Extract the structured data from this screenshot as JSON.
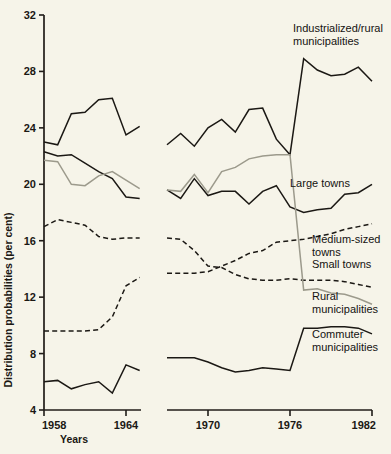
{
  "chart_data": {
    "type": "line",
    "title": "",
    "xlabel": "Years",
    "ylabel": "Distribution probabilities (per cent)",
    "xlim": [
      1958,
      1982
    ],
    "ylim": [
      4,
      32
    ],
    "xticks": [
      1958,
      1964,
      1970,
      1976,
      1982
    ],
    "yticks": [
      4,
      8,
      12,
      16,
      20,
      24,
      28,
      32
    ],
    "grid": false,
    "legend_position": "inline-right",
    "axis_break": {
      "after_x": 1965,
      "before_x": 1967
    },
    "series": [
      {
        "name": "Industrialized/rural municipalities",
        "style": "solid",
        "color": "#1b1814",
        "label_x": 1977.4,
        "label_y": 31.1,
        "segments": [
          {
            "x": [
              1958,
              1959,
              1960,
              1961,
              1962,
              1963,
              1964,
              1965
            ],
            "y": [
              23.0,
              22.8,
              25.0,
              25.1,
              26.0,
              26.1,
              23.5,
              24.1
            ]
          },
          {
            "x": [
              1967,
              1968,
              1969,
              1970,
              1971,
              1972,
              1973,
              1974,
              1975,
              1976,
              1977,
              1978,
              1979,
              1980,
              1981,
              1982
            ],
            "y": [
              22.8,
              23.6,
              22.7,
              24.0,
              24.6,
              23.7,
              25.3,
              25.4,
              23.2,
              22.1,
              28.9,
              28.1,
              27.7,
              27.8,
              28.3,
              27.3
            ]
          }
        ]
      },
      {
        "name": "Large towns",
        "style": "solid",
        "color": "#1b1814",
        "label_x": 1977.0,
        "label_y": 20.6,
        "segments": [
          {
            "x": [
              1958,
              1959,
              1960,
              1961,
              1962,
              1963,
              1964,
              1965
            ],
            "y": [
              22.3,
              22.0,
              22.1,
              21.5,
              20.9,
              20.4,
              19.1,
              19.0
            ]
          },
          {
            "x": [
              1967,
              1968,
              1969,
              1970,
              1971,
              1972,
              1973,
              1974,
              1975,
              1976,
              1977,
              1978,
              1979,
              1980,
              1981,
              1982
            ],
            "y": [
              19.6,
              19.0,
              20.4,
              19.2,
              19.5,
              19.5,
              18.6,
              19.5,
              19.9,
              18.4,
              18.0,
              18.2,
              18.3,
              19.3,
              19.4,
              20.0
            ]
          }
        ]
      },
      {
        "name": "Medium-sized towns",
        "style": "dashed",
        "color": "#1b1814",
        "label_x": 1977.1,
        "label_y": 15.3,
        "segments": [
          {
            "x": [
              1958,
              1959,
              1960,
              1961,
              1962,
              1963,
              1964,
              1965
            ],
            "y": [
              17.0,
              17.5,
              17.3,
              17.1,
              16.3,
              16.1,
              16.2,
              16.2
            ]
          },
          {
            "x": [
              1967,
              1968,
              1969,
              1970,
              1971,
              1972,
              1973,
              1974,
              1975,
              1976,
              1977,
              1978,
              1979,
              1980,
              1981,
              1982
            ],
            "y": [
              16.2,
              16.1,
              15.3,
              14.2,
              14.1,
              13.6,
              13.3,
              13.2,
              13.2,
              13.3,
              13.2,
              13.2,
              13.2,
              13.1,
              12.9,
              12.7
            ]
          }
        ]
      },
      {
        "name": "Small towns",
        "style": "dashed",
        "color": "#1b1814",
        "label_x": 1977.1,
        "label_y": 13.4,
        "segments": [
          {
            "x": [
              1958,
              1959,
              1960,
              1961,
              1962,
              1963,
              1964,
              1965
            ],
            "y": [
              9.6,
              9.6,
              9.6,
              9.6,
              9.7,
              10.6,
              12.8,
              13.4
            ]
          },
          {
            "x": [
              1967,
              1968,
              1969,
              1970,
              1971,
              1972,
              1973,
              1974,
              1975,
              1976,
              1977,
              1978,
              1979,
              1980,
              1981,
              1982
            ],
            "y": [
              13.7,
              13.7,
              13.7,
              13.8,
              14.2,
              14.6,
              15.1,
              15.3,
              15.9,
              16.0,
              16.1,
              16.3,
              16.5,
              16.8,
              17.0,
              17.2
            ]
          }
        ]
      },
      {
        "name": "Rural municipalities",
        "style": "solid",
        "color": "#9c9a8c",
        "label_x": 1977.2,
        "label_y": 11.9,
        "segments": [
          {
            "x": [
              1958,
              1959,
              1960,
              1961,
              1962,
              1963,
              1964,
              1965
            ],
            "y": [
              21.7,
              21.6,
              20.0,
              19.9,
              20.6,
              20.9,
              20.3,
              19.7
            ]
          },
          {
            "x": [
              1967,
              1968,
              1969,
              1970,
              1971,
              1972,
              1973,
              1974,
              1975,
              1976,
              1977,
              1978,
              1979,
              1980,
              1981,
              1982
            ],
            "y": [
              19.6,
              19.5,
              20.7,
              19.4,
              20.9,
              21.2,
              21.8,
              22.0,
              22.1,
              22.1,
              12.5,
              12.6,
              12.3,
              12.2,
              11.9,
              11.5
            ]
          }
        ]
      },
      {
        "name": "Commuter municipalities",
        "style": "solid",
        "color": "#1b1814",
        "label_x": 1977.2,
        "label_y": 9.7,
        "segments": [
          {
            "x": [
              1958,
              1959,
              1960,
              1961,
              1962,
              1963,
              1964,
              1965
            ],
            "y": [
              6.0,
              6.1,
              5.5,
              5.8,
              6.0,
              5.2,
              7.2,
              6.8
            ]
          },
          {
            "x": [
              1967,
              1968,
              1969,
              1970,
              1971,
              1972,
              1973,
              1974,
              1975,
              1976,
              1977,
              1978,
              1979,
              1980,
              1981,
              1982
            ],
            "y": [
              7.7,
              7.7,
              7.7,
              7.4,
              7.0,
              6.7,
              6.8,
              7.0,
              6.9,
              6.8,
              9.8,
              9.8,
              9.9,
              9.9,
              9.8,
              9.4
            ]
          }
        ]
      }
    ],
    "series_labels": [
      {
        "id": "industrialized-rural",
        "lines": [
          "Industrialized/rural",
          "municipalities"
        ],
        "x": 293,
        "y": 32
      },
      {
        "id": "large-towns",
        "lines": [
          "Large towns"
        ],
        "x": 290,
        "y": 187
      },
      {
        "id": "medium-sized-towns",
        "lines": [
          "Medium-sized",
          "towns"
        ],
        "x": 312,
        "y": 243
      },
      {
        "id": "small-towns",
        "lines": [
          "Small towns"
        ],
        "x": 312,
        "y": 268
      },
      {
        "id": "rural-municipalities",
        "lines": [
          "Rural",
          "municipalities"
        ],
        "x": 312,
        "y": 300
      },
      {
        "id": "commuter-municipalities",
        "lines": [
          "Commuter",
          "municipalities"
        ],
        "x": 312,
        "y": 338
      }
    ]
  },
  "colors": {
    "background": "#f6f4e9",
    "ink": "#1b1814",
    "grey_series": "#9c9a8c"
  }
}
